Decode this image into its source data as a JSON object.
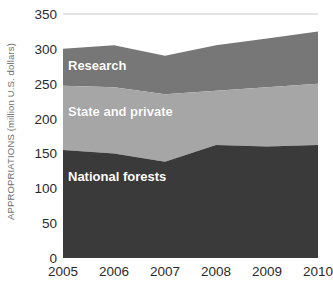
{
  "chart_data": {
    "type": "area",
    "stacked": true,
    "title": "",
    "subtitle": "",
    "xlabel": "",
    "ylabel": "APPROPRIATIONS (million U.S. dollars)",
    "categories": [
      "2005",
      "2006",
      "2007",
      "2008",
      "2009",
      "2010"
    ],
    "x": [
      2005,
      2006,
      2007,
      2008,
      2009,
      2010
    ],
    "xlim": [
      2005,
      2010
    ],
    "ylim": [
      0,
      350
    ],
    "yticks": [
      0,
      50,
      100,
      150,
      200,
      250,
      300,
      350
    ],
    "ytick_labels": [
      "0",
      "50",
      "100",
      "150",
      "200",
      "250",
      "300",
      "350"
    ],
    "xticks": [
      2005,
      2006,
      2007,
      2008,
      2009,
      2010
    ],
    "xtick_labels": [
      "2005",
      "2006",
      "2007",
      "2008",
      "2009",
      "2010"
    ],
    "grid": false,
    "top_rule_value": 350,
    "legend_position": "inline-labels",
    "series": [
      {
        "name": "National forests",
        "color": "#3a3a3a",
        "values": [
          155,
          150,
          138,
          162,
          160,
          162
        ]
      },
      {
        "name": "State and private",
        "color": "#a6a6a6",
        "values": [
          92,
          95,
          97,
          78,
          85,
          88
        ]
      },
      {
        "name": "Research",
        "color": "#777777",
        "values": [
          53,
          60,
          55,
          65,
          70,
          75
        ]
      }
    ],
    "cumulative_tops": {
      "national_forests": [
        155,
        150,
        138,
        162,
        160,
        162
      ],
      "state_and_private": [
        247,
        245,
        235,
        240,
        245,
        250
      ],
      "research_total": [
        300,
        305,
        290,
        305,
        315,
        325
      ]
    },
    "annotations": [
      {
        "name": "Research",
        "text": "Research"
      },
      {
        "name": "State and private",
        "text": "State and private"
      },
      {
        "name": "National forests",
        "text": "National forests"
      }
    ]
  },
  "axis": {
    "y_title": "APPROPRIATIONS (million U.S. dollars)",
    "y_ticks": [
      "350",
      "300",
      "250",
      "200",
      "150",
      "100",
      "50",
      "0"
    ],
    "x_ticks": [
      "2005",
      "2006",
      "2007",
      "2008",
      "2009",
      "2010"
    ]
  },
  "labels": {
    "research": "Research",
    "state_and_private": "State and private",
    "national_forests": "National forests"
  },
  "colors": {
    "national_forests": "#3a3a3a",
    "state_and_private": "#a6a6a6",
    "research": "#777777",
    "top_rule": "#c8c8c8",
    "tick_text": "#2a2a2a",
    "axis_title_text": "#6e6e6e",
    "series_label_text": "#ffffff",
    "background": "#ffffff"
  }
}
